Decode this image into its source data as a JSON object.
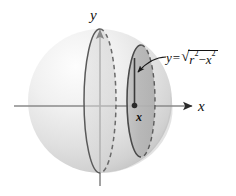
{
  "figure": {
    "axes": {
      "y_label": "y",
      "x_label": "x",
      "point_label": "x"
    },
    "equation": {
      "lhs": "y",
      "equals": "=",
      "radical_sign": "√",
      "term1_base": "r",
      "term1_exp": "2",
      "operator": "−",
      "term2_base": "x",
      "term2_exp": "2",
      "full_text": "y = √(r² − x²)"
    },
    "colors": {
      "sphere_light": "#fbfbfb",
      "sphere_mid": "#e3e3e3",
      "sphere_dark": "#c9c9c9",
      "disk_fill": "#bdbdbd",
      "outline": "#4a4a4a",
      "axis": "#888888",
      "text": "#111111"
    },
    "elements": {
      "sphere": "sphere-body",
      "center_ellipse": "center-cross-section",
      "right_ellipse": "right-cross-section-disk",
      "radius_line": "disk-radius-line",
      "center_dot": "x-axis-point",
      "callout_arrow": "equation-callout-arrow"
    }
  }
}
